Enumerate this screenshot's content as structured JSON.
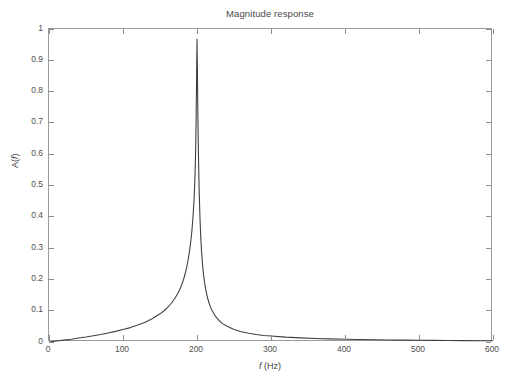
{
  "chart_data": {
    "type": "line",
    "title": "Magnitude response",
    "xlabel": "f (Hz)",
    "xlabel_italic_part": "f",
    "xlabel_rest": " (Hz)",
    "ylabel": "A(f)",
    "ylabel_prefix": "A(",
    "ylabel_italic_part": "f",
    "ylabel_suffix": ")",
    "xlim": [
      0,
      600
    ],
    "ylim": [
      0,
      1
    ],
    "xticks": [
      0,
      100,
      200,
      300,
      400,
      500,
      600
    ],
    "xtick_labels": [
      "0",
      "100",
      "200",
      "300",
      "400",
      "500",
      "600"
    ],
    "yticks": [
      0,
      0.1,
      0.2,
      0.3,
      0.4,
      0.5,
      0.6,
      0.7,
      0.8,
      0.9,
      1
    ],
    "ytick_labels": [
      "0",
      "0.1",
      "0.2",
      "0.3",
      "0.4",
      "0.5",
      "0.6",
      "0.7",
      "0.8",
      "0.9",
      "1"
    ],
    "grid": false,
    "legend": null,
    "box": true,
    "tick_direction": "in",
    "line_color": "#404040",
    "axis_color": "#9a9a9a",
    "background": "#ffffff",
    "resonance": {
      "peak_frequency_hz": 200,
      "peak_amplitude": 0.967,
      "half_power_bandwidth_hz": 8
    },
    "series": [
      {
        "name": "A(f)",
        "color": "#404040",
        "x": [
          0,
          10,
          20,
          30,
          40,
          50,
          60,
          70,
          80,
          90,
          100,
          110,
          120,
          130,
          140,
          150,
          155,
          160,
          165,
          170,
          175,
          178,
          180,
          182,
          184,
          186,
          188,
          190,
          191,
          192,
          193,
          194,
          195,
          196,
          196.5,
          197,
          197.5,
          198,
          198.5,
          199,
          199.5,
          200,
          200.5,
          201,
          201.5,
          202,
          202.5,
          203,
          204,
          205,
          206,
          207,
          208,
          209,
          210,
          212,
          214,
          216,
          218,
          220,
          225,
          230,
          235,
          240,
          250,
          260,
          270,
          280,
          290,
          300,
          320,
          340,
          360,
          380,
          400,
          420,
          440,
          460,
          480,
          500,
          520,
          540,
          560,
          580,
          600
        ],
        "y": [
          0.0,
          0.003,
          0.006,
          0.009,
          0.013,
          0.016,
          0.02,
          0.024,
          0.029,
          0.034,
          0.04,
          0.046,
          0.054,
          0.063,
          0.075,
          0.09,
          0.099,
          0.11,
          0.123,
          0.139,
          0.159,
          0.175,
          0.187,
          0.201,
          0.218,
          0.238,
          0.262,
          0.292,
          0.31,
          0.33,
          0.353,
          0.381,
          0.414,
          0.455,
          0.48,
          0.51,
          0.548,
          0.596,
          0.66,
          0.744,
          0.859,
          0.967,
          0.882,
          0.766,
          0.671,
          0.594,
          0.531,
          0.479,
          0.398,
          0.339,
          0.295,
          0.261,
          0.234,
          0.212,
          0.194,
          0.165,
          0.143,
          0.127,
          0.113,
          0.102,
          0.082,
          0.068,
          0.058,
          0.051,
          0.04,
          0.033,
          0.028,
          0.024,
          0.021,
          0.019,
          0.0155,
          0.0131,
          0.0113,
          0.0099,
          0.0088,
          0.0079,
          0.0071,
          0.0065,
          0.006,
          0.0055,
          0.0051,
          0.0048,
          0.0045,
          0.0042,
          0.004
        ]
      }
    ]
  }
}
